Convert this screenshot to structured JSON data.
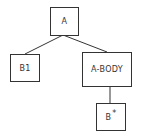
{
  "diagram": {
    "type": "tree",
    "nodes": [
      {
        "id": "a",
        "label": "A"
      },
      {
        "id": "b1",
        "label": "B1"
      },
      {
        "id": "a_body",
        "label": "A-BODY"
      },
      {
        "id": "b_star",
        "label": "B",
        "superscript": "*"
      }
    ],
    "edges": [
      {
        "from": "A",
        "to": "B1"
      },
      {
        "from": "A",
        "to": "A-BODY"
      },
      {
        "from": "A-BODY",
        "to": "B*"
      }
    ],
    "colors": {
      "stroke": "#333333",
      "background": "#ffffff"
    }
  }
}
